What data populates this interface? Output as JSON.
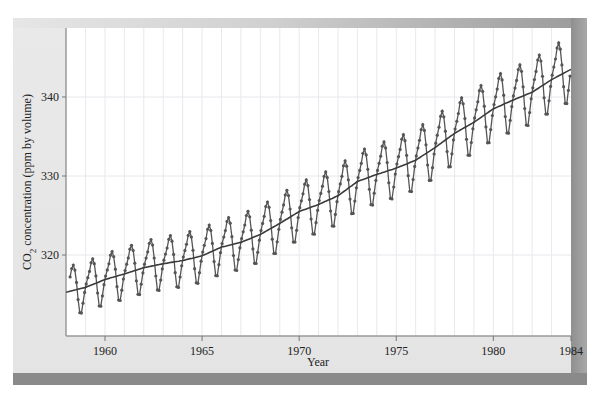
{
  "chart_data": {
    "type": "line",
    "title": "",
    "xlabel": "Year",
    "ylabel": "CO2 concentration (ppm by volume)",
    "ylabel_parts": {
      "prefix": "CO",
      "subscript": "2",
      "suffix": " concentration (ppm by volume)"
    },
    "xlim": [
      1958,
      1984
    ],
    "ylim": [
      310,
      349
    ],
    "x_ticks": [
      1960,
      1965,
      1970,
      1975,
      1980,
      1984
    ],
    "x_tick_labels": [
      "1960",
      "1965",
      "1970",
      "1975",
      "1980",
      "1984"
    ],
    "y_ticks": [
      320,
      330,
      340
    ],
    "y_tick_labels": [
      "320",
      "330",
      "340"
    ],
    "grid": {
      "vertical": "yearly",
      "horizontal": [
        320,
        330,
        340
      ]
    },
    "legend": null,
    "series": [
      {
        "name": "Monthly mean CO2 (seasonal cycle)",
        "style": "line-with-dot-markers",
        "start": 1958.2,
        "step_months": 1,
        "note": "monthly values = trend + seasonal offset",
        "seasonal_offset_by_month": [
          0.4,
          1.1,
          1.8,
          2.8,
          3.2,
          2.5,
          0.9,
          -1.3,
          -3.0,
          -3.1,
          -1.9,
          -0.6
        ]
      },
      {
        "name": "Smoothed trend",
        "style": "solid-line",
        "x": [
          1958,
          1959,
          1960,
          1961,
          1962,
          1963,
          1964,
          1965,
          1966,
          1967,
          1968,
          1969,
          1970,
          1971,
          1972,
          1973,
          1974,
          1975,
          1976,
          1977,
          1978,
          1979,
          1980,
          1981,
          1982,
          1983,
          1984
        ],
        "values": [
          315.3,
          315.9,
          316.9,
          317.6,
          318.4,
          318.9,
          319.3,
          319.9,
          321.0,
          321.6,
          322.6,
          324.0,
          325.5,
          326.4,
          327.5,
          329.3,
          330.2,
          331.0,
          332.0,
          333.6,
          335.4,
          336.8,
          338.5,
          339.6,
          340.6,
          342.2,
          343.5
        ]
      }
    ]
  },
  "colors": {
    "panel_bg": "#e6e6e6",
    "plot_bg": "#ffffff",
    "grid": "#e8e8ee",
    "series_line": "#555555",
    "series_marker": "#555555",
    "trend_line": "#3a3a3a",
    "bar_dark": "#8a8a8a"
  }
}
